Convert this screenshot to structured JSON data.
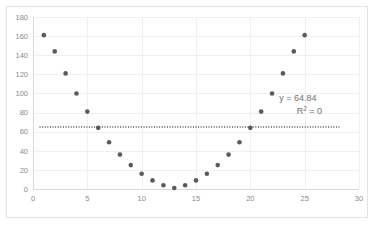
{
  "chart_data": {
    "type": "scatter",
    "title": "",
    "xlabel": "",
    "ylabel": "",
    "xlim": [
      0,
      30
    ],
    "ylim": [
      0,
      180
    ],
    "xticks": [
      0,
      5,
      10,
      15,
      20,
      25,
      30
    ],
    "yticks": [
      0,
      20,
      40,
      60,
      80,
      100,
      120,
      140,
      160,
      180
    ],
    "grid": true,
    "legend": "none",
    "x": [
      1,
      2,
      3,
      4,
      5,
      6,
      7,
      8,
      9,
      10,
      11,
      12,
      13,
      14,
      15,
      16,
      17,
      18,
      19,
      20,
      21,
      22,
      23,
      24,
      25
    ],
    "y": [
      161,
      144,
      121,
      100,
      81,
      64,
      49,
      36,
      25,
      16,
      9,
      4,
      1,
      4,
      9,
      16,
      25,
      36,
      49,
      64,
      81,
      100,
      121,
      144,
      161
    ],
    "series": [
      {
        "name": "series-1",
        "marker": "circle",
        "color": "#5a5a5a",
        "values": [
          161,
          144,
          121,
          100,
          81,
          64,
          49,
          36,
          25,
          16,
          9,
          4,
          1,
          4,
          9,
          16,
          25,
          36,
          49,
          64,
          81,
          100,
          121,
          144,
          161
        ]
      }
    ],
    "trendline": {
      "type": "linear",
      "style": "dotted",
      "color": "#4f4f4f",
      "value": 64.84,
      "equation_label": "y = 64.84",
      "r2_label": "R² = 0",
      "r2_value": 0
    },
    "annotations": [
      {
        "text": "y = 64.84",
        "x": 21.3,
        "y": 92
      },
      {
        "text": "R² = 0",
        "x": 23.2,
        "y": 78
      }
    ]
  },
  "axes": {
    "x_tick_labels": [
      "0",
      "5",
      "10",
      "15",
      "20",
      "25",
      "30"
    ],
    "y_tick_labels": [
      "0",
      "20",
      "40",
      "60",
      "80",
      "100",
      "120",
      "140",
      "160",
      "180"
    ]
  },
  "annotation": {
    "equation": "y = 64.84",
    "r2_prefix": "R",
    "r2_sup": "2",
    "r2_suffix": " = 0"
  },
  "colors": {
    "marker": "#5a5a5a",
    "grid": "#f0f0f0",
    "axis": "#d9d9d9",
    "frame_border": "#e3e3e3",
    "tick_text": "#8a8a8a",
    "annotation_text": "#6f6f6f",
    "background": "#ffffff"
  }
}
